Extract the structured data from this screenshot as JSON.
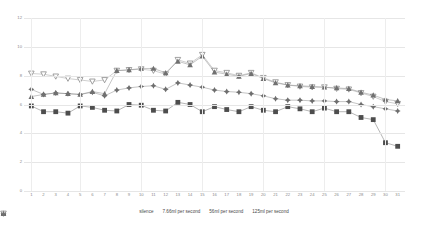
{
  "chart_data": {
    "type": "line",
    "title": "",
    "xlabel": "",
    "ylabel": "",
    "xlim": [
      0.4,
      31.6
    ],
    "ylim": [
      0,
      12
    ],
    "grid": true,
    "legend_position": "bottom-center",
    "x": [
      1,
      2,
      3,
      4,
      5,
      6,
      7,
      8,
      9,
      10,
      11,
      12,
      13,
      14,
      15,
      16,
      17,
      18,
      19,
      20,
      21,
      22,
      23,
      24,
      25,
      26,
      27,
      28,
      29,
      30,
      31
    ],
    "xtick_labels": [
      "1",
      "2",
      "3",
      "4",
      "5",
      "6",
      "7",
      "8",
      "9",
      "10",
      "11",
      "12",
      "13",
      "14",
      "15",
      "16",
      "17",
      "18",
      "19",
      "20",
      "21",
      "22",
      "23",
      "24",
      "25",
      "26",
      "27",
      "28",
      "29",
      "30",
      "31"
    ],
    "ytick_labels": [
      "0",
      "2",
      "4",
      "6",
      "8",
      "10",
      "12"
    ],
    "yticks": [
      0,
      2,
      4,
      6,
      8,
      10,
      12
    ],
    "series": [
      {
        "name": "silence",
        "marker": "filled-square",
        "color": "#4d4d4d",
        "values": [
          5.9,
          5.5,
          5.5,
          5.4,
          5.9,
          5.8,
          5.6,
          5.55,
          6.0,
          5.95,
          5.6,
          5.55,
          6.15,
          6.0,
          5.5,
          5.85,
          5.65,
          5.5,
          5.85,
          5.6,
          5.5,
          5.85,
          5.7,
          5.5,
          5.75,
          5.5,
          5.5,
          5.1,
          4.95,
          3.35,
          3.1
        ]
      },
      {
        "name": "7.66ml per second",
        "marker": "plus-diamond",
        "color": "#6e6e6e",
        "values": [
          7.05,
          6.7,
          6.8,
          6.75,
          6.7,
          6.85,
          6.6,
          7.0,
          7.15,
          7.25,
          7.3,
          7.05,
          7.5,
          7.35,
          7.2,
          7.0,
          6.9,
          6.85,
          6.75,
          6.6,
          6.4,
          6.3,
          6.3,
          6.25,
          6.25,
          6.2,
          6.2,
          6.0,
          5.85,
          5.7,
          5.55
        ]
      },
      {
        "name": "56ml per second",
        "marker": "open-down-triangle",
        "color": "#8a8a8a",
        "values": [
          8.15,
          8.1,
          7.95,
          7.8,
          7.7,
          7.6,
          7.7,
          8.35,
          8.4,
          8.45,
          8.35,
          8.1,
          9.1,
          8.85,
          9.45,
          8.35,
          8.2,
          8.0,
          8.2,
          7.85,
          7.55,
          7.35,
          7.25,
          7.2,
          7.2,
          7.1,
          7.05,
          6.8,
          6.55,
          6.2,
          6.05
        ]
      },
      {
        "name": "125ml per second",
        "marker": "filled-up-triangle",
        "color": "#707070",
        "values": [
          6.55,
          6.7,
          6.8,
          6.75,
          6.7,
          6.9,
          6.75,
          8.35,
          8.4,
          8.5,
          8.5,
          8.2,
          9.0,
          8.75,
          9.35,
          8.25,
          8.1,
          7.95,
          8.15,
          7.8,
          7.5,
          7.35,
          7.3,
          7.25,
          7.2,
          7.15,
          7.1,
          6.85,
          6.65,
          6.35,
          6.25
        ]
      }
    ]
  },
  "legend": {
    "items": [
      {
        "label": "silence"
      },
      {
        "label": "7.66ml per second"
      },
      {
        "label": "56ml per second"
      },
      {
        "label": "125ml per second"
      }
    ]
  }
}
